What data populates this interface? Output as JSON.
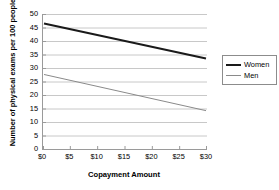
{
  "chart_data": {
    "type": "line",
    "title": "",
    "xlabel": "Copayment Amount",
    "ylabel": "Number of physical exams per 100 people",
    "x": [
      0,
      5,
      10,
      15,
      20,
      25,
      30
    ],
    "xtick_labels": [
      "$0",
      "$5",
      "$10",
      "$15",
      "$20",
      "$25",
      "$30"
    ],
    "ytick_labels": [
      "0",
      "5",
      "10",
      "15",
      "20",
      "25",
      "30",
      "35",
      "40",
      "45",
      "50"
    ],
    "ytick_values": [
      0,
      5,
      10,
      15,
      20,
      25,
      30,
      35,
      40,
      45,
      50
    ],
    "xlim": [
      0,
      30
    ],
    "ylim": [
      0,
      50
    ],
    "grid": "horizontal",
    "legend_position": "right",
    "series": [
      {
        "name": "Women",
        "color": "#1a1a1a",
        "width": 2,
        "endpoints": [
          {
            "x": 0,
            "y": 46.5
          },
          {
            "x": 30,
            "y": 33.5
          }
        ],
        "values": [
          46.5,
          44.3,
          42.2,
          40.0,
          37.8,
          35.7,
          33.5
        ]
      },
      {
        "name": "Men",
        "color": "#8a8a8a",
        "width": 1,
        "endpoints": [
          {
            "x": 0,
            "y": 27.6
          },
          {
            "x": 30,
            "y": 14.2
          }
        ],
        "values": [
          27.6,
          25.4,
          23.1,
          20.9,
          18.7,
          16.4,
          14.2
        ]
      }
    ]
  },
  "legend": {
    "items": [
      {
        "label": "Women"
      },
      {
        "label": "Men"
      }
    ]
  },
  "colors": {
    "women_line": "#1a1a1a",
    "men_line": "#8a8a8a",
    "gridline": "#c8c8c8",
    "axis": "#9a9a9a",
    "background": "#ffffff",
    "text": "#000000"
  }
}
